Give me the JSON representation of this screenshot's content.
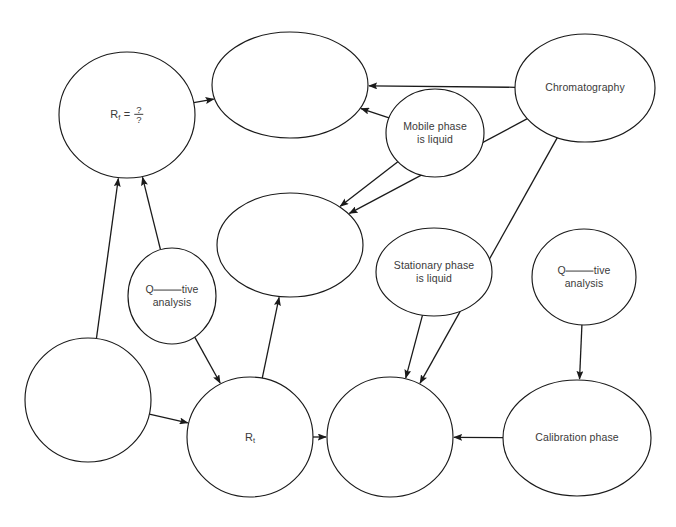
{
  "diagram": {
    "type": "concept-map",
    "canvas": {
      "width": 676,
      "height": 527
    },
    "style": {
      "background": "#ffffff",
      "node_fill": "#ffffff",
      "node_stroke": "#1a1a1a",
      "edge_stroke": "#1a1a1a",
      "text_color": "#3a3a3a"
    },
    "nodes": [
      {
        "id": "rf",
        "label": "Rf = ?/?",
        "label_kind": "formula",
        "label_parts": {
          "symbol": "R",
          "subscript": "f",
          "equals": "=",
          "numerator": "?",
          "denominator": "?"
        },
        "cx": 127,
        "cy": 115,
        "rx": 68,
        "ry": 63,
        "empty": false
      },
      {
        "id": "top-blank",
        "label": "",
        "label_kind": "blank-node",
        "cx": 290,
        "cy": 85,
        "rx": 78,
        "ry": 53,
        "empty": true
      },
      {
        "id": "mobile-phase",
        "label": "Mobile phase\nis liquid",
        "label_kind": "text",
        "cx": 435,
        "cy": 133,
        "rx": 49,
        "ry": 44,
        "empty": false
      },
      {
        "id": "chromatography",
        "label": "Chromatography",
        "label_kind": "text",
        "cx": 585,
        "cy": 88,
        "rx": 70,
        "ry": 54,
        "empty": false
      },
      {
        "id": "middle-blank",
        "label": "",
        "label_kind": "blank-node",
        "cx": 290,
        "cy": 245,
        "rx": 73,
        "ry": 52,
        "empty": true
      },
      {
        "id": "stationary-phase",
        "label": "Stationary phase\nis liquid",
        "label_kind": "text",
        "cx": 434,
        "cy": 272,
        "rx": 58,
        "ry": 44,
        "empty": false
      },
      {
        "id": "quant-right",
        "label": "Q_____tive\nanalysis",
        "label_kind": "fill-in-blank",
        "label_parts": {
          "prefix": "Q",
          "blank": "_____",
          "suffix": "tive",
          "second_line": "analysis"
        },
        "cx": 584,
        "cy": 277,
        "rx": 52,
        "ry": 48,
        "empty": false
      },
      {
        "id": "quant-left",
        "label": "Q_____tive\nanalysis",
        "label_kind": "fill-in-blank",
        "label_parts": {
          "prefix": "Q",
          "blank": "_____",
          "suffix": "tive",
          "second_line": "analysis"
        },
        "cx": 172,
        "cy": 296,
        "rx": 44,
        "ry": 48,
        "empty": false
      },
      {
        "id": "bottom-left-blank",
        "label": "",
        "label_kind": "blank-node",
        "cx": 88,
        "cy": 400,
        "rx": 63,
        "ry": 62,
        "empty": true
      },
      {
        "id": "rt",
        "label": "Rt",
        "label_kind": "formula",
        "label_parts": {
          "symbol": "R",
          "subscript": "t"
        },
        "cx": 250,
        "cy": 437,
        "rx": 63,
        "ry": 60,
        "empty": false
      },
      {
        "id": "bottom-mid-blank",
        "label": "",
        "label_kind": "blank-node",
        "cx": 390,
        "cy": 437,
        "rx": 63,
        "ry": 60,
        "empty": true
      },
      {
        "id": "calibration-phase",
        "label": "Calibration phase",
        "label_kind": "text",
        "cx": 577,
        "cy": 438,
        "rx": 74,
        "ry": 58,
        "empty": false
      }
    ],
    "edges": [
      {
        "id": "e1",
        "from": "rf",
        "to": "top-blank",
        "arrow": true
      },
      {
        "id": "e2",
        "from": "chromatography",
        "to": "top-blank",
        "arrow": true
      },
      {
        "id": "e3",
        "from": "mobile-phase",
        "to": "top-blank",
        "arrow": true
      },
      {
        "id": "e4",
        "from": "mobile-phase",
        "to": "middle-blank",
        "arrow": true
      },
      {
        "id": "e5",
        "from": "chromatography",
        "to": "middle-blank",
        "arrow": true
      },
      {
        "id": "e6",
        "from": "chromatography",
        "to": "bottom-mid-blank",
        "arrow": true
      },
      {
        "id": "e7",
        "from": "bottom-left-blank",
        "to": "rf",
        "arrow": true
      },
      {
        "id": "e8",
        "from": "quant-left",
        "to": "rf",
        "arrow": true
      },
      {
        "id": "e9",
        "from": "quant-left",
        "to": "rt",
        "arrow": true
      },
      {
        "id": "e10",
        "from": "bottom-left-blank",
        "to": "rt",
        "arrow": true
      },
      {
        "id": "e11",
        "from": "rt",
        "to": "middle-blank",
        "arrow": true
      },
      {
        "id": "e12",
        "from": "rt",
        "to": "bottom-mid-blank",
        "arrow": true
      },
      {
        "id": "e13",
        "from": "stationary-phase",
        "to": "bottom-mid-blank",
        "arrow": true
      },
      {
        "id": "e14",
        "from": "calibration-phase",
        "to": "bottom-mid-blank",
        "arrow": true
      },
      {
        "id": "e15",
        "from": "quant-right",
        "to": "calibration-phase",
        "arrow": true
      }
    ]
  }
}
